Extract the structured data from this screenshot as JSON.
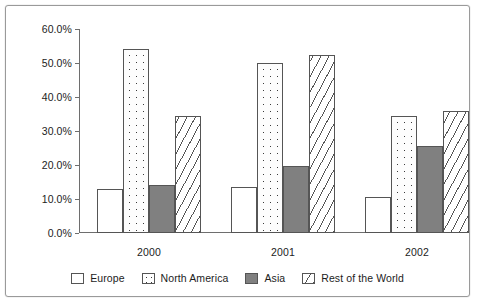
{
  "chart_data": {
    "type": "bar",
    "title": "",
    "xlabel": "",
    "ylabel": "",
    "categories": [
      "2000",
      "2001",
      "2002"
    ],
    "series": [
      {
        "name": "Europe",
        "values": [
          12.8,
          13.5,
          10.5
        ],
        "pattern": "solid-white"
      },
      {
        "name": "North America",
        "values": [
          54.0,
          50.0,
          34.5
        ],
        "pattern": "dotted"
      },
      {
        "name": "Asia",
        "values": [
          14.0,
          19.8,
          25.5
        ],
        "pattern": "solid-gray"
      },
      {
        "name": "Rest of the World",
        "values": [
          34.5,
          52.5,
          36.0
        ],
        "pattern": "diagonal-hatch"
      }
    ],
    "ylim": [
      0,
      60
    ],
    "ytick_values": [
      0,
      10,
      20,
      30,
      40,
      50,
      60
    ],
    "ytick_labels": [
      "0.0%",
      "10.0%",
      "20.0%",
      "30.0%",
      "40.0%",
      "50.0%",
      "60.0%"
    ],
    "grid": false,
    "legend_position": "bottom",
    "legend_entries": [
      "Europe",
      "North America",
      "Asia",
      "Rest of the World"
    ],
    "colors": {
      "europe": "#ffffff",
      "north_america": "#ffffff",
      "asia": "#808080",
      "rest_of_the_world": "#ffffff",
      "outline": "#555555",
      "axis": "#6e6e6e",
      "text": "#1c1c1c",
      "frame_border": "#9a9a9a"
    }
  }
}
